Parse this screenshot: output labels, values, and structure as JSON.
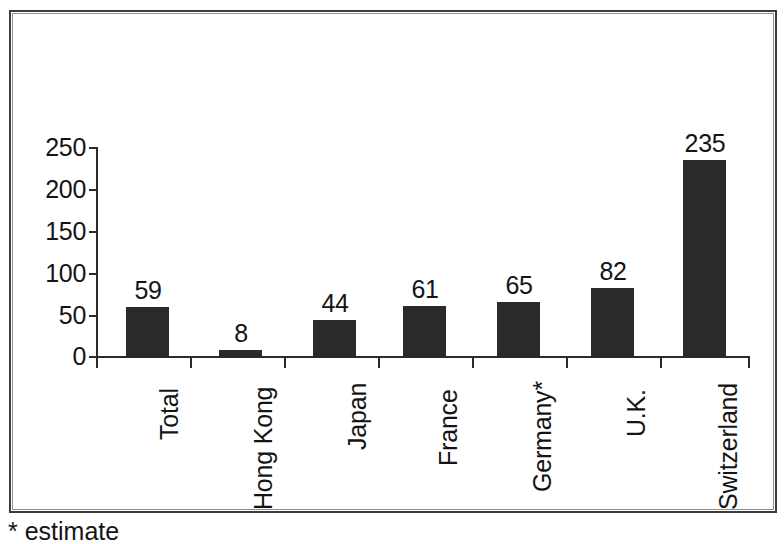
{
  "figure": {
    "footnote": "* estimate",
    "frame_color": "#3c3c3c",
    "bar_color": "#2a2a2a",
    "background_color": "#ffffff",
    "text_color": "#141414"
  },
  "chart_data": {
    "type": "bar",
    "title": "",
    "subtitle": "",
    "xlabel": "",
    "ylabel": "",
    "categories": [
      "Total",
      "Hong Kong",
      "Japan",
      "France",
      "Germany*",
      "U.K.",
      "Switzerland"
    ],
    "values": [
      59,
      8,
      44,
      61,
      65,
      82,
      235
    ],
    "data_labels": [
      "59",
      "8",
      "44",
      "61",
      "65",
      "82",
      "235"
    ],
    "ylim": [
      0,
      250
    ],
    "ytick_labels": [
      "250",
      "200",
      "150",
      "100",
      "50",
      "0"
    ],
    "ytick_values": [
      250,
      200,
      150,
      100,
      50,
      0
    ],
    "ytick_interval": 50,
    "grid": false,
    "legend": null,
    "legend_position": "none",
    "annotations": [
      "* estimate"
    ],
    "label_rotation_degrees": -90,
    "series": [
      {
        "name": "",
        "values": [
          59,
          8,
          44,
          61,
          65,
          82,
          235
        ]
      }
    ]
  }
}
